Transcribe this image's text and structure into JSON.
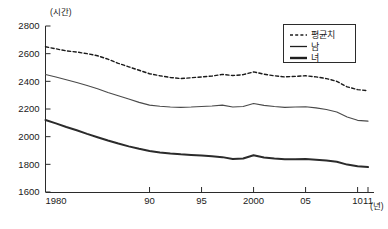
{
  "chart_data": {
    "type": "line",
    "title": "",
    "xlabel": "년",
    "ylabel": "",
    "yunit": "(시간)",
    "xunit": "(년)",
    "xlim": [
      1980,
      2011
    ],
    "ylim": [
      1600,
      2800
    ],
    "grid": false,
    "legend_position": "top-right",
    "ytick_labels": [
      "2800",
      "2600",
      "2400",
      "2200",
      "2000",
      "1800",
      "1600"
    ],
    "ytick_values": [
      2800,
      2600,
      2400,
      2200,
      2000,
      1800,
      1600
    ],
    "xtick_labels": [
      "1980",
      "90",
      "95",
      "2000",
      "05",
      "10",
      "11"
    ],
    "xtick_values": [
      1980,
      1990,
      1995,
      2000,
      2005,
      2010,
      2011
    ],
    "x": [
      1980,
      1981,
      1982,
      1983,
      1984,
      1985,
      1986,
      1987,
      1988,
      1989,
      1990,
      1991,
      1992,
      1993,
      1994,
      1995,
      1996,
      1997,
      1998,
      1999,
      2000,
      2001,
      2002,
      2003,
      2004,
      2005,
      2006,
      2007,
      2008,
      2009,
      2010,
      2011
    ],
    "series": [
      {
        "name": "평균치",
        "style": "dashed",
        "color": "#1a1a1a",
        "width": 1.4,
        "values": [
          2650,
          2635,
          2620,
          2612,
          2600,
          2585,
          2560,
          2530,
          2505,
          2480,
          2455,
          2440,
          2428,
          2420,
          2426,
          2432,
          2438,
          2450,
          2442,
          2448,
          2468,
          2452,
          2440,
          2432,
          2436,
          2440,
          2432,
          2420,
          2400,
          2360,
          2340,
          2332
        ]
      },
      {
        "name": "남",
        "style": "solid",
        "color": "#4a4a4a",
        "width": 1.1,
        "values": [
          2450,
          2432,
          2412,
          2392,
          2370,
          2346,
          2320,
          2296,
          2272,
          2248,
          2228,
          2220,
          2215,
          2212,
          2214,
          2218,
          2222,
          2228,
          2214,
          2218,
          2240,
          2226,
          2218,
          2212,
          2214,
          2216,
          2208,
          2196,
          2178,
          2142,
          2118,
          2112
        ]
      },
      {
        "name": "녀",
        "style": "solid",
        "color": "#2b2b2b",
        "width": 2.0,
        "values": [
          2120,
          2096,
          2070,
          2046,
          2020,
          1996,
          1972,
          1950,
          1930,
          1912,
          1896,
          1886,
          1878,
          1872,
          1868,
          1864,
          1858,
          1852,
          1838,
          1842,
          1866,
          1850,
          1842,
          1836,
          1836,
          1838,
          1834,
          1828,
          1818,
          1798,
          1786,
          1780
        ]
      }
    ]
  },
  "legend": {
    "items": [
      {
        "label": "평균치",
        "style": "dashed"
      },
      {
        "label": "남",
        "style": "thin"
      },
      {
        "label": "녀",
        "style": "thick"
      }
    ]
  },
  "axes": {
    "y_unit_text": "(시간)",
    "x_unit_text": "(년)"
  }
}
